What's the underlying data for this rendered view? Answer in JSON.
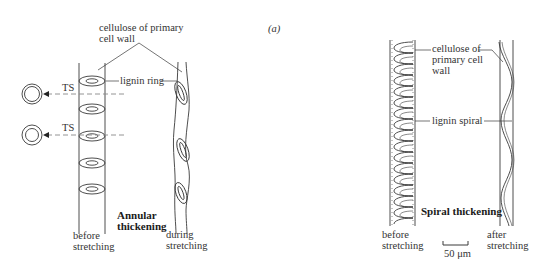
{
  "figure": {
    "panel_label": "(a)",
    "left_panel": {
      "title_line1": "Annular",
      "title_line2": "thickening",
      "label_cellulose_line1": "cellulose of primary",
      "label_cellulose_line2": "cell wall",
      "label_lignin": "lignin ring",
      "ts_label_1": "TS",
      "ts_label_2": "TS",
      "caption_before_line1": "before",
      "caption_before_line2": "stretching",
      "caption_during_line1": "during",
      "caption_during_line2": "stretching"
    },
    "right_panel": {
      "title": "Spiral thickening",
      "label_cellulose_line1": "cellulose of",
      "label_cellulose_line2": "primary cell",
      "label_cellulose_line3": "wall",
      "label_lignin": "lignin spiral",
      "caption_before_line1": "before",
      "caption_before_line2": "stretching",
      "caption_after_line1": "after",
      "caption_after_line2": "stretching",
      "scale_bar": "50 μm"
    },
    "colors": {
      "line": "#3a3a3a",
      "dashed": "#888888",
      "background": "#ffffff"
    }
  }
}
